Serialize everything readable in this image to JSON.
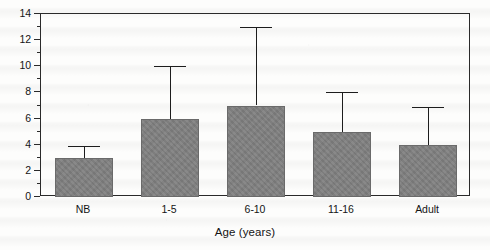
{
  "chart_data": {
    "type": "bar",
    "title": "",
    "subtitle": "",
    "xlabel": "Age (years)",
    "ylabel": "",
    "categories": [
      "NB",
      "1-5",
      "6-10",
      "11-16",
      "Adult"
    ],
    "values": [
      3,
      6,
      7,
      5,
      4
    ],
    "error_upper": [
      3.9,
      10,
      13,
      8,
      6.9
    ],
    "series": [
      {
        "name": "",
        "values": [
          3,
          6,
          7,
          5,
          4
        ],
        "error_upper": [
          3.9,
          10,
          13,
          8,
          6.9
        ]
      }
    ],
    "ylim": [
      0,
      14
    ],
    "xlim": [
      0,
      5
    ],
    "y_major_ticks": [
      0,
      2,
      4,
      6,
      8,
      10,
      12,
      14
    ],
    "y_minor_ticks": [
      1,
      3,
      5,
      7,
      9,
      11,
      13
    ],
    "y_tick_labels": [
      "0",
      "2",
      "4",
      "6",
      "8",
      "10",
      "12",
      "14"
    ],
    "grid": false,
    "legend": false,
    "legend_position": "none",
    "error_bar_style": "upper-only-capped",
    "bar_color": "#7e7e7e",
    "axis_color": "#2a2a2a",
    "background_color": "#fdfdfc"
  },
  "axes": {
    "y": {
      "labels": [
        "14",
        "12",
        "10",
        "8",
        "6",
        "4",
        "2",
        "0"
      ],
      "values": [
        14,
        12,
        10,
        8,
        6,
        4,
        2,
        0
      ],
      "minor_values": [
        13,
        11,
        9,
        7,
        5,
        3,
        1
      ]
    },
    "x": {
      "title": "Age (years)",
      "labels": [
        "NB",
        "1-5",
        "6-10",
        "11-16",
        "Adult"
      ]
    }
  }
}
